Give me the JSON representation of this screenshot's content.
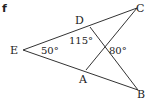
{
  "part_label": "f",
  "points": {
    "E": {
      "label": "E",
      "x": 23,
      "y": 50
    },
    "D": {
      "label": "D",
      "x": 90,
      "y": 27
    },
    "C": {
      "label": "C",
      "x": 137,
      "y": 8
    },
    "A": {
      "label": "A",
      "x": 86,
      "y": 70
    },
    "B": {
      "label": "B",
      "x": 138,
      "y": 90
    }
  },
  "angles": {
    "E": "50°",
    "D": "115°",
    "X": "80°"
  },
  "segments": [
    [
      "E",
      "C"
    ],
    [
      "E",
      "B"
    ],
    [
      "D",
      "B"
    ],
    [
      "A",
      "C"
    ]
  ]
}
